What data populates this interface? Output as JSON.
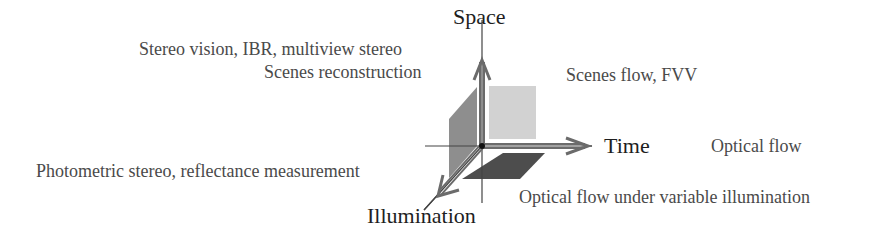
{
  "diagram": {
    "type": "3d-axes-diagram",
    "axes": {
      "space": "Space",
      "time": "Time",
      "illumination": "Illumination"
    },
    "applications": {
      "space_plane_top_left": "Stereo vision, IBR, multiview stereo",
      "space_plane_top_left_line2": "Scenes reconstruction",
      "space_time_plane": "Scenes flow, FVV",
      "time_axis": "Optical flow",
      "illumination_axis": "Photometric stereo, reflectance measurement",
      "time_illumination_plane": "Optical flow under variable illumination"
    },
    "colors": {
      "space_time_plane": "#d2d2d2",
      "space_illumination_plane": "#8c8c8c",
      "time_illumination_plane": "#4a4a4a",
      "arrow": "#6a6a6a",
      "axis_line": "#444444"
    }
  }
}
